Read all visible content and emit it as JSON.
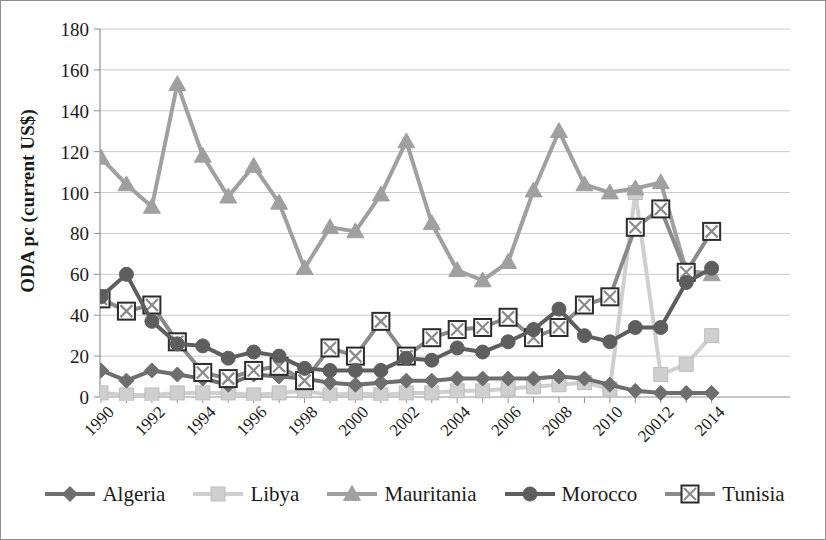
{
  "chart_data": {
    "type": "line",
    "title": "",
    "xlabel": "",
    "ylabel": "ODA pc (current US$)",
    "ylim": [
      0,
      180
    ],
    "ytick_step": 20,
    "yticks": [
      0,
      20,
      40,
      60,
      80,
      100,
      120,
      140,
      160,
      180
    ],
    "grid": true,
    "legend_position": "bottom",
    "x": [
      1990,
      1991,
      1992,
      1993,
      1994,
      1995,
      1996,
      1997,
      1998,
      1999,
      2000,
      2001,
      2002,
      2003,
      2004,
      2005,
      2006,
      2007,
      2008,
      2009,
      2010,
      2011,
      2012,
      2013,
      2014
    ],
    "xtick_labels": [
      "1990",
      "1992",
      "1994",
      "1996",
      "1998",
      "2000",
      "2002",
      "2004",
      "2006",
      "2008",
      "2010",
      "20012",
      "2014"
    ],
    "xtick_values": [
      1990,
      1992,
      1994,
      1996,
      1998,
      2000,
      2002,
      2004,
      2006,
      2008,
      2010,
      2012,
      2014
    ],
    "series": [
      {
        "name": "Algeria",
        "marker": "diamond",
        "color": "#6e6e6e",
        "values": [
          13,
          8,
          13,
          11,
          9,
          6,
          11,
          10,
          9,
          7,
          6,
          7,
          8,
          8,
          9,
          9,
          9,
          9,
          10,
          9,
          6,
          3,
          2,
          2,
          2
        ]
      },
      {
        "name": "Libya",
        "marker": "square-light",
        "color": "#cfcfcf",
        "values": [
          2,
          1,
          1,
          2,
          2,
          2,
          1,
          2,
          3,
          1,
          2,
          1,
          2,
          2,
          3,
          3,
          4,
          5,
          6,
          7,
          4,
          100,
          11,
          16,
          30
        ]
      },
      {
        "name": "Mauritania",
        "marker": "triangle",
        "color": "#a0a0a0",
        "values": [
          117,
          104,
          93,
          153,
          118,
          98,
          113,
          95,
          63,
          83,
          81,
          99,
          125,
          85,
          62,
          57,
          66,
          101,
          130,
          104,
          100,
          102,
          105,
          62,
          60
        ]
      },
      {
        "name": "Morocco",
        "marker": "circle",
        "color": "#5e5e5e",
        "values": [
          49,
          60,
          37,
          26,
          25,
          19,
          22,
          20,
          14,
          13,
          13,
          13,
          19,
          18,
          24,
          22,
          27,
          33,
          43,
          30,
          27,
          34,
          34,
          56,
          63
        ]
      },
      {
        "name": "Tunisia",
        "marker": "square-x",
        "color": "#8a8a8a",
        "values": [
          48,
          42,
          45,
          27,
          12,
          9,
          13,
          15,
          8,
          24,
          20,
          37,
          20,
          29,
          33,
          34,
          39,
          29,
          34,
          45,
          49,
          83,
          92,
          61,
          81
        ]
      }
    ]
  },
  "legend": {
    "items": [
      {
        "label": "Algeria"
      },
      {
        "label": "Libya"
      },
      {
        "label": "Mauritania"
      },
      {
        "label": "Morocco"
      },
      {
        "label": "Tunisia"
      }
    ]
  }
}
